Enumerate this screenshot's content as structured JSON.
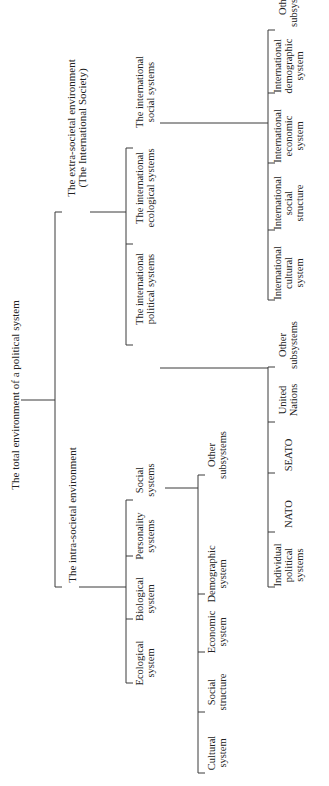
{
  "diagram": {
    "root": {
      "label": "The total environment of a political system"
    },
    "intra": {
      "label": [
        "The intra-societal environment"
      ],
      "children": [
        {
          "label": [
            "Ecological",
            "system"
          ]
        },
        {
          "label": [
            "Biological",
            "system"
          ]
        },
        {
          "label": [
            "Personality",
            "systems"
          ]
        },
        {
          "label": [
            "Social",
            "systems"
          ]
        }
      ],
      "social_children": [
        {
          "label": [
            "Cultural",
            "system"
          ]
        },
        {
          "label": [
            "Social",
            "structure"
          ]
        },
        {
          "label": [
            "Economic",
            "system"
          ]
        },
        {
          "label": [
            "Demographic",
            "system"
          ]
        },
        {
          "label": [
            "Other",
            "subsystems"
          ]
        }
      ]
    },
    "extra": {
      "label": [
        "The extra-societal environment",
        "(The International Society)"
      ],
      "children": [
        {
          "label": [
            "The international",
            "political systems"
          ]
        },
        {
          "label": [
            "The international",
            "ecological systems"
          ]
        },
        {
          "label": [
            "The international",
            "social systems"
          ]
        }
      ],
      "political_children": [
        {
          "label": [
            "Individual",
            "political",
            "systems"
          ]
        },
        {
          "label": [
            "NATO"
          ]
        },
        {
          "label": [
            "SEATO"
          ]
        },
        {
          "label": [
            "United",
            "Nations"
          ]
        },
        {
          "label": [
            "Other",
            "subsystems"
          ]
        }
      ],
      "social_children": [
        {
          "label": [
            "International",
            "cultural",
            "system"
          ]
        },
        {
          "label": [
            "International",
            "social",
            "structure"
          ]
        },
        {
          "label": [
            "International",
            "economic",
            "system"
          ]
        },
        {
          "label": [
            "International",
            "demographic",
            "system"
          ]
        },
        {
          "label": [
            "Other",
            "subsystems"
          ]
        }
      ]
    }
  }
}
